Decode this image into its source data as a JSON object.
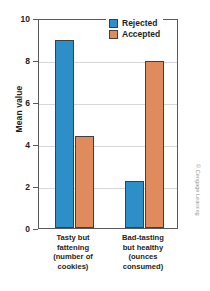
{
  "chart_data": {
    "type": "bar",
    "title": "",
    "xlabel": "",
    "ylabel": "Mean value",
    "ylim": [
      0,
      10
    ],
    "yticks": [
      0,
      2,
      4,
      6,
      8,
      10
    ],
    "ytick_labels": [
      "0",
      "2",
      "4",
      "6",
      "8",
      "10"
    ],
    "grid": true,
    "legend_position": "top-right",
    "categories": [
      "Tasty but fattening (number of cookies)",
      "Bad-tasting but healthy (ounces consumed)"
    ],
    "category_lines": [
      [
        "Tasty but",
        "fattening",
        "(number of",
        "cookies)"
      ],
      [
        "Bad-tasting",
        "but healthy",
        "(ounces",
        "consumed)"
      ]
    ],
    "series": [
      {
        "name": "Rejected",
        "color": "#2e8fc8",
        "values": [
          8.95,
          2.25
        ]
      },
      {
        "name": "Accepted",
        "color": "#e08b5e",
        "values": [
          4.4,
          7.95
        ]
      }
    ]
  },
  "legend": {
    "items": [
      {
        "label": "Rejected",
        "color": "#2e8fc8"
      },
      {
        "label": "Accepted",
        "color": "#e08b5e"
      }
    ]
  },
  "credit": "© Cengage Learning",
  "colors": {
    "rejected": "#2e8fc8",
    "accepted": "#e08b5e",
    "axis": "#58595b",
    "grid": "#d6d7d9",
    "text": "#231f20"
  }
}
